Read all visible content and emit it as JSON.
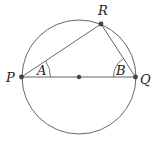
{
  "diagram": {
    "type": "geometry",
    "circle": {
      "cx": 79,
      "cy": 77,
      "r": 57,
      "stroke": "#555555"
    },
    "points": {
      "P": {
        "label": "P",
        "x": 21.5,
        "y": 77
      },
      "Q": {
        "label": "Q",
        "x": 135.5,
        "y": 77
      },
      "R": {
        "label": "R",
        "x": 101,
        "y": 24
      },
      "O": {
        "label": "",
        "x": 79,
        "y": 77
      }
    },
    "angles": {
      "A": {
        "label": "A",
        "vertex": "P"
      },
      "B": {
        "label": "B",
        "vertex": "Q"
      }
    },
    "colors": {
      "line": "#555555",
      "point": "#444444",
      "text": "#222222"
    }
  }
}
